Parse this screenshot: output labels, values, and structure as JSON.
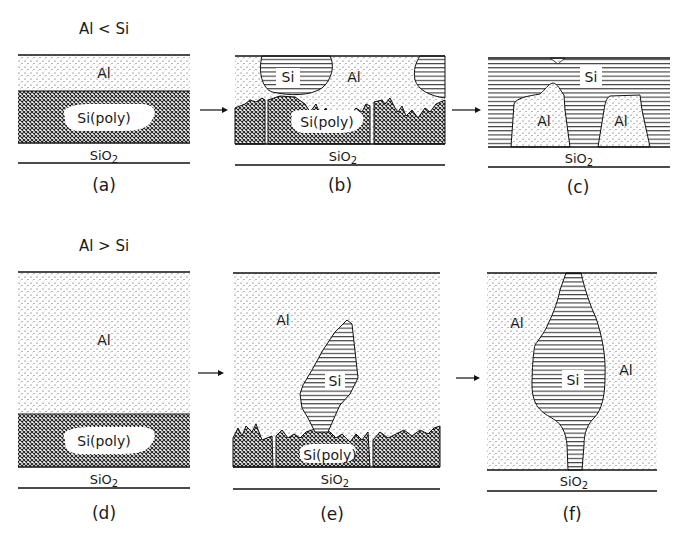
{
  "figure": {
    "colors": {
      "ink": "#1a1a1a",
      "background": "#ffffff"
    },
    "legend_patterns": {
      "Al": "stippled dots",
      "Si(poly)": "cross-hatch",
      "Si": "horizontal lines",
      "SiO2": "blank"
    },
    "rows": [
      {
        "condition": "Al < Si"
      },
      {
        "condition": "Al > Si"
      }
    ],
    "panels": {
      "a": {
        "caption": "(a)",
        "al": "Al",
        "sipoly": "Si(poly)",
        "sio2": "SiO2"
      },
      "b": {
        "caption": "(b)",
        "si": "Si",
        "al": "Al",
        "sipoly": "Si(poly)",
        "sio2": "SiO2"
      },
      "c": {
        "caption": "(c)",
        "si": "Si",
        "al1": "Al",
        "al2": "Al",
        "sio2": "SiO2"
      },
      "d": {
        "caption": "(d)",
        "al": "Al",
        "sipoly": "Si(poly)",
        "sio2": "SiO2"
      },
      "e": {
        "caption": "(e)",
        "al": "Al",
        "si": "Si",
        "sipoly": "Si(poly)",
        "sio2": "SiO2"
      },
      "f": {
        "caption": "(f)",
        "al1": "Al",
        "al2": "Al",
        "si": "Si",
        "sio2": "SiO2"
      }
    },
    "arrows": [
      "a-to-b",
      "b-to-c",
      "d-to-e",
      "e-to-f"
    ]
  }
}
